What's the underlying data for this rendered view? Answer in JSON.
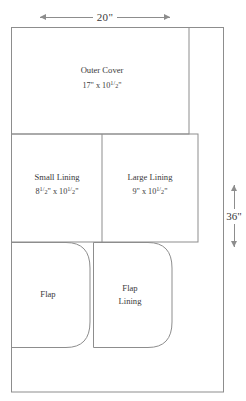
{
  "diagram": {
    "line_color": "#8d8d8d",
    "text_color": "#3a3a3a",
    "background": "#ffffff"
  },
  "dimensions": {
    "width_label": "20\"",
    "height_label": "36\"",
    "width_arrow_left": "⟵",
    "width_arrow_right": "⟶",
    "height_arrow_up": "↑",
    "height_arrow_down": "↓"
  },
  "pieces": [
    {
      "id": "outer-cover",
      "name": "Outer Cover",
      "dims": "17\" x 10½\"",
      "dims_whole": "17\" x 10",
      "dims_frac_num": "1",
      "dims_frac_den": "2",
      "dims_suffix": "\""
    },
    {
      "id": "small-lining",
      "name": "Small Lining",
      "dims": "8½\" x 10½\"",
      "dims_a_whole": "8",
      "dims_a_num": "1",
      "dims_a_den": "2",
      "dims_mid": "\" x 10",
      "dims_b_num": "1",
      "dims_b_den": "2",
      "dims_suffix": "\""
    },
    {
      "id": "large-lining",
      "name": "Large Lining",
      "dims": "9\" x 10½\"",
      "dims_whole": "9\" x 10",
      "dims_frac_num": "1",
      "dims_frac_den": "2",
      "dims_suffix": "\""
    },
    {
      "id": "flap",
      "name": "Flap",
      "dims": ""
    },
    {
      "id": "flap-lining",
      "name_line1": "Flap",
      "name_line2": "Lining",
      "dims": ""
    }
  ]
}
